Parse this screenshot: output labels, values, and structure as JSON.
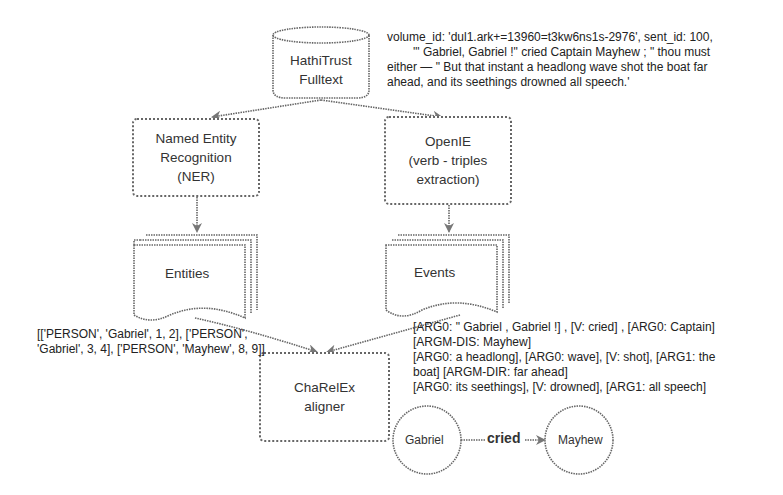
{
  "nodes": {
    "source": {
      "line1": "HathiTrust",
      "line2": "Fulltext"
    },
    "ner": {
      "line1": "Named Entity",
      "line2": "Recognition",
      "line3": "(NER)"
    },
    "openie": {
      "line1": "OpenIE",
      "line2": "(verb - triples",
      "line3": "extraction)"
    },
    "entities": {
      "label": "Entities"
    },
    "events": {
      "label": "Events"
    },
    "aligner": {
      "line1": "ChaRelEx",
      "line2": "aligner"
    },
    "person_a": {
      "label": "Gabriel"
    },
    "person_b": {
      "label": "Mayhew"
    },
    "relation": {
      "label": "cried"
    }
  },
  "annotations": {
    "sentence": {
      "line1": "volume_id: 'dul1.ark+=13960=t3kw6ns1s-2976', sent_id: 100,",
      "line2": "'\" Gabriel, Gabriel !\" cried Captain Mayhew ; \" thou must",
      "line3": "either — \" But that instant a headlong wave shot the boat far",
      "line4": "ahead, and its seethings drowned all speech.'"
    },
    "entities_output": {
      "line1": "[['PERSON', 'Gabriel', 1, 2], ['PERSON',",
      "line2": "'Gabriel', 3, 4], ['PERSON', 'Mayhew', 8, 9]]"
    },
    "events_output": {
      "line1": "[ARG0: \" Gabriel , Gabriel !] , [V: cried] , [ARG0: Captain]",
      "line2": "[ARGM-DIS: Mayhew]",
      "line3": "[ARG0: a headlong], [ARG0: wave], [V: shot], [ARG1: the",
      "line4": "boat] [ARGM-DIR: far ahead]",
      "line5": "[ARG0: its seethings], [V: drowned], [ARG1: all speech]"
    }
  }
}
